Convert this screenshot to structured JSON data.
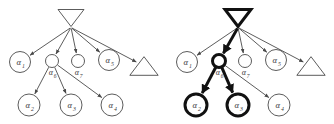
{
  "figure": {
    "type": "two-panel-tree-diagram",
    "background_color": "#ffffff",
    "thin_stroke_color": "#4a4a4a",
    "bold_stroke_color": "#111111",
    "thin_stroke_width": 0.9,
    "bold_stroke_width": 3.0,
    "label_color": "#3a3a3a"
  },
  "panels": [
    {
      "id": "left-panel",
      "name": "original-tree",
      "offset_x": 0,
      "highlighted": false,
      "root": {
        "name": "root-node",
        "shape": "triangle-down",
        "cx": 71,
        "cy": 18,
        "half_width": 13,
        "height": 17,
        "bold": false,
        "label": ""
      },
      "nodes": [
        {
          "id": "a1",
          "label": "α",
          "sub": "1",
          "shape": "circle",
          "cx": 20,
          "cy": 62,
          "r": 10.5,
          "bold": false,
          "label_pos": "inside"
        },
        {
          "id": "a6",
          "label": "α",
          "sub": "6",
          "shape": "circle",
          "cx": 52,
          "cy": 61,
          "r": 6.5,
          "bold": false,
          "label_pos": "below"
        },
        {
          "id": "a7",
          "label": "α",
          "sub": "7",
          "shape": "circle",
          "cx": 78,
          "cy": 61,
          "r": 6.5,
          "bold": false,
          "label_pos": "below"
        },
        {
          "id": "a5",
          "label": "α",
          "sub": "5",
          "shape": "circle",
          "cx": 109,
          "cy": 60,
          "r": 10.5,
          "bold": false,
          "label_pos": "inside"
        },
        {
          "id": "tri_leaf",
          "label": "",
          "sub": "",
          "shape": "triangle-up",
          "cx": 144,
          "cy": 66,
          "r": 12,
          "bold": false,
          "label_pos": "none"
        },
        {
          "id": "a2",
          "label": "α",
          "sub": "2",
          "shape": "circle",
          "cx": 29,
          "cy": 105,
          "r": 11,
          "bold": false,
          "label_pos": "inside"
        },
        {
          "id": "a3",
          "label": "α",
          "sub": "3",
          "shape": "circle",
          "cx": 71,
          "cy": 105,
          "r": 11,
          "bold": false,
          "label_pos": "inside"
        },
        {
          "id": "a4",
          "label": "α",
          "sub": "4",
          "shape": "circle",
          "cx": 112,
          "cy": 105,
          "r": 11,
          "bold": false,
          "label_pos": "inside"
        }
      ],
      "edges": [
        {
          "from": "root",
          "to": "a1",
          "bold": false
        },
        {
          "from": "root",
          "to": "a6",
          "bold": false
        },
        {
          "from": "root",
          "to": "a7",
          "bold": false
        },
        {
          "from": "root",
          "to": "a5",
          "bold": false
        },
        {
          "from": "root",
          "to": "tri_leaf",
          "bold": false
        },
        {
          "from": "a6",
          "to": "a2",
          "bold": false
        },
        {
          "from": "a6",
          "to": "a3",
          "bold": false
        },
        {
          "from": "a6",
          "to": "a4",
          "bold": false
        }
      ]
    },
    {
      "id": "right-panel",
      "name": "highlighted-tree",
      "offset_x": 167,
      "highlighted": true,
      "root": {
        "name": "root-node",
        "shape": "triangle-down",
        "cx": 71,
        "cy": 18,
        "half_width": 13,
        "height": 17,
        "bold": true,
        "label": ""
      },
      "nodes": [
        {
          "id": "a1",
          "label": "α",
          "sub": "1",
          "shape": "circle",
          "cx": 20,
          "cy": 62,
          "r": 10.5,
          "bold": false,
          "label_pos": "inside"
        },
        {
          "id": "a6",
          "label": "α",
          "sub": "6",
          "shape": "circle",
          "cx": 52,
          "cy": 61,
          "r": 6.5,
          "bold": true,
          "label_pos": "below"
        },
        {
          "id": "a7",
          "label": "α",
          "sub": "7",
          "shape": "circle",
          "cx": 78,
          "cy": 61,
          "r": 6.5,
          "bold": false,
          "label_pos": "below"
        },
        {
          "id": "a5",
          "label": "α",
          "sub": "5",
          "shape": "circle",
          "cx": 109,
          "cy": 60,
          "r": 10.5,
          "bold": false,
          "label_pos": "inside"
        },
        {
          "id": "tri_leaf",
          "label": "",
          "sub": "",
          "shape": "triangle-up",
          "cx": 144,
          "cy": 66,
          "r": 12,
          "bold": false,
          "label_pos": "none"
        },
        {
          "id": "a2",
          "label": "α",
          "sub": "2",
          "shape": "circle",
          "cx": 29,
          "cy": 105,
          "r": 11,
          "bold": true,
          "label_pos": "inside"
        },
        {
          "id": "a3",
          "label": "α",
          "sub": "3",
          "shape": "circle",
          "cx": 71,
          "cy": 105,
          "r": 11,
          "bold": true,
          "label_pos": "inside"
        },
        {
          "id": "a4",
          "label": "α",
          "sub": "4",
          "shape": "circle",
          "cx": 112,
          "cy": 105,
          "r": 11,
          "bold": false,
          "label_pos": "inside"
        }
      ],
      "edges": [
        {
          "from": "root",
          "to": "a1",
          "bold": false
        },
        {
          "from": "root",
          "to": "a6",
          "bold": true
        },
        {
          "from": "root",
          "to": "a7",
          "bold": false
        },
        {
          "from": "root",
          "to": "a5",
          "bold": false
        },
        {
          "from": "root",
          "to": "tri_leaf",
          "bold": false
        },
        {
          "from": "a6",
          "to": "a2",
          "bold": true
        },
        {
          "from": "a6",
          "to": "a3",
          "bold": true
        },
        {
          "from": "a6",
          "to": "a4",
          "bold": false
        }
      ]
    }
  ]
}
